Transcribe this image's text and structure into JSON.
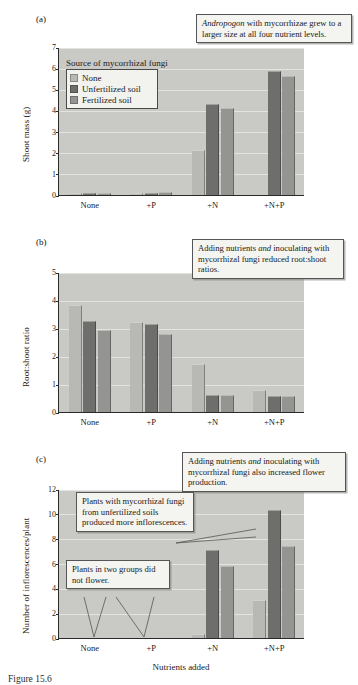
{
  "figure": {
    "caption_partial": "Figure 15.6",
    "xlabel": "Nutrients added",
    "categories": [
      "None",
      "+P",
      "+N",
      "+N+P"
    ],
    "series_names": [
      "None",
      "Unfertilized soil",
      "Fertilized soil"
    ],
    "legend_title": "Source of mycorrhizal fungi",
    "colors": {
      "series_none": "#b8b8b4",
      "series_unfertilized": "#6e6e6c",
      "series_fertilized": "#949492",
      "plot_background": "#c9c9c5",
      "gridline": "#e8e8e4",
      "callout_background": "#f4f4f0",
      "axis": "#2a2a2a"
    }
  },
  "panels": {
    "a": {
      "letter": "(a)",
      "callout": "Andropogon with mycorrhizae grew to a larger size at all four nutrient levels.",
      "callout_italic_lead": "Andropogon",
      "callout_rest": " with mycorrhizae grew to a larger size at all four nutrient levels."
    },
    "b": {
      "letter": "(b)",
      "callout_part1": "Adding nutrients ",
      "callout_italic": "and",
      "callout_part2": " inoculating with mycorrhizal fungi reduced root:shoot ratios."
    },
    "c": {
      "letter": "(c)",
      "callout_top_part1": "Adding nutrients ",
      "callout_top_italic": "and",
      "callout_top_part2": " inoculating with mycorrhizal fungi also increased flower production.",
      "callout_mid": "Plants with mycorrhizal fungi from unfertilized soils produced more inflorescences.",
      "callout_low": "Plants in two groups did not flower."
    }
  },
  "chart_data": [
    {
      "type": "bar",
      "panel": "a",
      "title": "",
      "xlabel": "",
      "ylabel": "Shoot mass (g)",
      "ylim": [
        0,
        7
      ],
      "yticks": [
        0,
        1,
        2,
        3,
        4,
        5,
        6,
        7
      ],
      "grid": true,
      "legend_position": "inside-top-left",
      "categories": [
        "None",
        "+P",
        "+N",
        "+N+P"
      ],
      "series": [
        {
          "name": "None",
          "values": [
            0.08,
            0.09,
            0.0,
            0.0
          ]
        },
        {
          "name": "Unfertilized soil",
          "values": [
            0.1,
            0.11,
            4.3,
            5.85
          ]
        },
        {
          "name": "Fertilized soil",
          "values": [
            0.1,
            0.16,
            4.1,
            5.65
          ]
        }
      ],
      "extra_bars_note": "In the +N group a short bar of 2.15 appears for the None series",
      "none_series_plus_n": 2.15,
      "none_series_plus_n_p": 0.0
    },
    {
      "type": "bar",
      "panel": "b",
      "title": "",
      "xlabel": "",
      "ylabel": "Root:shoot ratio",
      "ylim": [
        0,
        5
      ],
      "yticks": [
        0,
        1,
        2,
        3,
        4,
        5
      ],
      "grid": true,
      "categories": [
        "None",
        "+P",
        "+N",
        "+N+P"
      ],
      "series": [
        {
          "name": "None",
          "values": [
            3.82,
            3.22,
            1.72,
            0.8
          ]
        },
        {
          "name": "Unfertilized soil",
          "values": [
            3.24,
            3.16,
            0.62,
            0.57
          ]
        },
        {
          "name": "Fertilized soil",
          "values": [
            2.93,
            2.79,
            0.6,
            0.58
          ]
        }
      ]
    },
    {
      "type": "bar",
      "panel": "c",
      "title": "",
      "xlabel": "Nutrients added",
      "ylabel": "Number of inflorescences/plant",
      "ylim": [
        0,
        12
      ],
      "yticks": [
        0,
        2,
        4,
        6,
        8,
        10,
        12
      ],
      "grid": true,
      "categories": [
        "None",
        "+P",
        "+N",
        "+N+P"
      ],
      "series": [
        {
          "name": "None",
          "values": [
            0.0,
            0.0,
            0.3,
            3.05
          ]
        },
        {
          "name": "Unfertilized soil",
          "values": [
            0.0,
            0.0,
            7.1,
            10.3
          ]
        },
        {
          "name": "Fertilized soil",
          "values": [
            0.0,
            0.0,
            5.8,
            7.45
          ]
        }
      ],
      "annotation_zero_groups": [
        "None",
        "+P"
      ]
    }
  ]
}
